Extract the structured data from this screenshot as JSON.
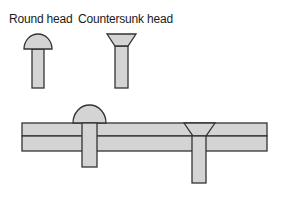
{
  "labels": {
    "round_head": "Round head",
    "countersunk_head": "Countersunk head"
  },
  "colors": {
    "fill": "#d4d4d4",
    "stroke": "#333333",
    "background": "#ffffff"
  }
}
